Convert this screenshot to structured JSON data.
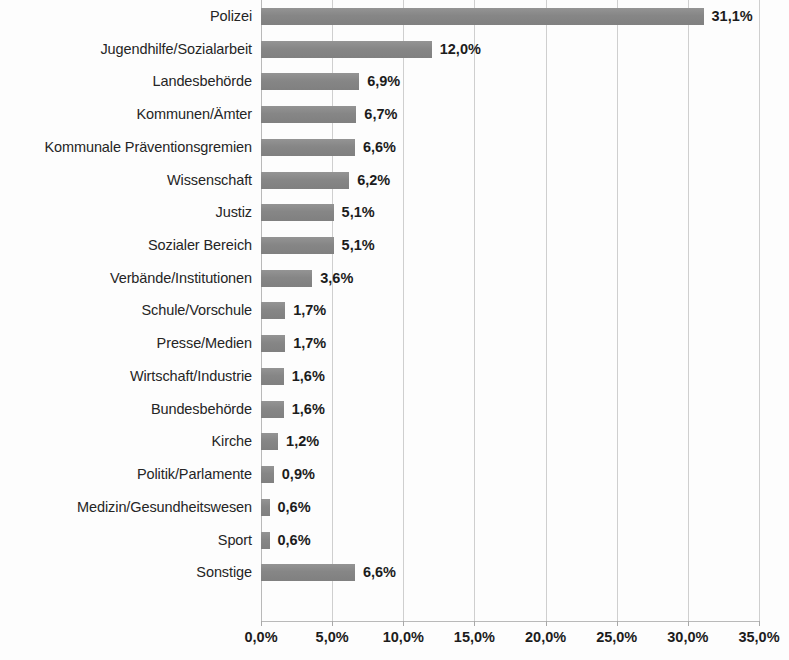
{
  "chart_data": {
    "type": "bar",
    "orientation": "horizontal",
    "title": "",
    "subtitle": "",
    "xlabel": "",
    "ylabel": "",
    "xlim": [
      0,
      35
    ],
    "grid": true,
    "legend": false,
    "bar_color": "#8b8b8b",
    "gridline_color": "#cfcfcf",
    "axis_color": "#b9b9b9",
    "text_color": "#1c1c1c",
    "value_suffix": "%",
    "decimal_separator": ",",
    "categories": [
      "Polizei",
      "Jugendhilfe/Sozialarbeit",
      "Landesbehörde",
      "Kommunen/Ämter",
      "Kommunale Präventionsgremien",
      "Wissenschaft",
      "Justiz",
      "Sozialer Bereich",
      "Verbände/Institutionen",
      "Schule/Vorschule",
      "Presse/Medien",
      "Wirtschaft/Industrie",
      "Bundesbehörde",
      "Kirche",
      "Politik/Parlamente",
      "Medizin/Gesundheitswesen",
      "Sport",
      "Sonstige"
    ],
    "values": [
      31.1,
      12.0,
      6.9,
      6.7,
      6.6,
      6.2,
      5.1,
      5.1,
      3.6,
      1.7,
      1.7,
      1.6,
      1.6,
      1.2,
      0.9,
      0.6,
      0.6,
      6.6
    ],
    "value_labels": [
      "31,1%",
      "12,0%",
      "6,9%",
      "6,7%",
      "6,6%",
      "6,2%",
      "5,1%",
      "5,1%",
      "3,6%",
      "1,7%",
      "1,7%",
      "1,6%",
      "1,6%",
      "1,2%",
      "0,9%",
      "0,6%",
      "0,6%",
      "6,6%"
    ],
    "xticks": [
      0,
      5,
      10,
      15,
      20,
      25,
      30,
      35
    ],
    "xtick_labels": [
      "0,0%",
      "5,0%",
      "10,0%",
      "15,0%",
      "20,0%",
      "25,0%",
      "30,0%",
      "35,0%"
    ]
  }
}
